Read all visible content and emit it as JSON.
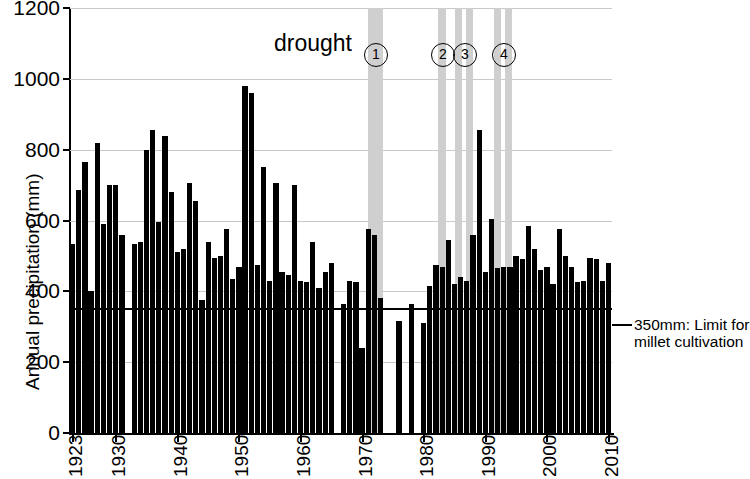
{
  "chart_data": {
    "type": "bar",
    "title": "",
    "xlabel": "",
    "ylabel": "Annual precipitation (mm)",
    "ylim": [
      0,
      1200
    ],
    "xlim": [
      1923,
      2010
    ],
    "grid": true,
    "legend": "none",
    "y_ticks": [
      0,
      200,
      400,
      600,
      800,
      1000,
      1200
    ],
    "x_ticks": [
      1923,
      1930,
      1940,
      1950,
      1960,
      1970,
      1980,
      1990,
      2000,
      2010
    ],
    "bar_color": "#000000",
    "band_color": "#cfcfcf",
    "x": [
      1923,
      1924,
      1925,
      1926,
      1927,
      1928,
      1929,
      1930,
      1931,
      1932,
      1933,
      1934,
      1935,
      1936,
      1937,
      1938,
      1939,
      1940,
      1941,
      1942,
      1943,
      1944,
      1945,
      1946,
      1947,
      1948,
      1949,
      1950,
      1951,
      1952,
      1953,
      1954,
      1955,
      1956,
      1957,
      1958,
      1959,
      1960,
      1961,
      1962,
      1963,
      1964,
      1965,
      1966,
      1967,
      1968,
      1969,
      1970,
      1971,
      1972,
      1973,
      1974,
      1975,
      1976,
      1977,
      1978,
      1979,
      1980,
      1981,
      1982,
      1983,
      1984,
      1985,
      1986,
      1987,
      1988,
      1989,
      1990,
      1991,
      1992,
      1993,
      1994,
      1995,
      1996,
      1997,
      1998,
      1999,
      2000,
      2001,
      2002,
      2003,
      2004,
      2005,
      2006,
      2007,
      2008,
      2009,
      2010
    ],
    "values": [
      535,
      685,
      765,
      400,
      820,
      590,
      700,
      700,
      560,
      null,
      535,
      540,
      800,
      855,
      595,
      840,
      680,
      510,
      520,
      705,
      655,
      375,
      540,
      495,
      500,
      575,
      435,
      470,
      980,
      960,
      475,
      750,
      430,
      705,
      455,
      445,
      700,
      430,
      425,
      540,
      410,
      455,
      480,
      null,
      365,
      430,
      425,
      240,
      575,
      560,
      380,
      null,
      null,
      315,
      null,
      365,
      null,
      310,
      415,
      475,
      470,
      545,
      420,
      440,
      430,
      560,
      855,
      455,
      605,
      465,
      470,
      470,
      500,
      490,
      585,
      520,
      460,
      470,
      420,
      575,
      500,
      470,
      425,
      430,
      495,
      490,
      430,
      480
    ],
    "missing_years": [
      1932,
      1966,
      1974,
      1975,
      1977,
      1979
    ],
    "threshold": {
      "value": 350,
      "label_line1": "350mm: Limit for",
      "label_line2": "millet cultivation"
    },
    "annotations": {
      "drought_label": "drought",
      "markers": [
        {
          "id": "1",
          "symbol": "①",
          "year_start": 1970,
          "year_end": 1972
        },
        {
          "id": "2",
          "symbol": "②",
          "year_start": 1982,
          "year_end": 1984
        },
        {
          "id": "3",
          "symbol": "③",
          "year_start": 1984,
          "year_end": 1986
        },
        {
          "id": "4",
          "symbol": "④",
          "year_start": 1990,
          "year_end": 1993
        }
      ],
      "bands": [
        {
          "x_start": 368,
          "x_end": 383
        },
        {
          "x_start": 438,
          "x_end": 446
        },
        {
          "x_start": 455,
          "x_end": 462
        },
        {
          "x_start": 466,
          "x_end": 473
        },
        {
          "x_start": 494,
          "x_end": 501
        },
        {
          "x_start": 505,
          "x_end": 512
        }
      ]
    }
  }
}
